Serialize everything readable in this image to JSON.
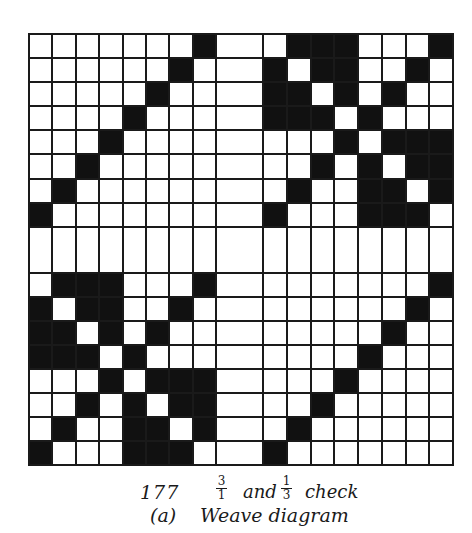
{
  "figure": {
    "number": "177",
    "title_fraction_1": {
      "numerator": "3",
      "denominator": "1"
    },
    "title_word_and": "and",
    "title_fraction_2": {
      "numerator": "1",
      "denominator": "3"
    },
    "title_word_check": "check",
    "subfigure_label": "(a)",
    "subfigure_title": "Weave diagram"
  },
  "colors": {
    "filled": "#111111",
    "empty": "#ffffff",
    "grid_line": "#1a1a1a"
  },
  "weave_grid": {
    "description": "18x18 point-paper grid: two 8x8 blocks per axis separated by a wider blank spacer column/row. 1 = filled (warp up), 0 = empty.",
    "column_groups": [
      8,
      1,
      8
    ],
    "row_groups": [
      8,
      1,
      8
    ],
    "blocks": {
      "diagonal_twill": [
        [
          0,
          0,
          0,
          0,
          0,
          0,
          0,
          1
        ],
        [
          0,
          0,
          0,
          0,
          0,
          0,
          1,
          0
        ],
        [
          0,
          0,
          0,
          0,
          0,
          1,
          0,
          0
        ],
        [
          0,
          0,
          0,
          0,
          1,
          0,
          0,
          0
        ],
        [
          0,
          0,
          0,
          1,
          0,
          0,
          0,
          0
        ],
        [
          0,
          0,
          1,
          0,
          0,
          0,
          0,
          0
        ],
        [
          0,
          1,
          0,
          0,
          0,
          0,
          0,
          0
        ],
        [
          1,
          0,
          0,
          0,
          0,
          0,
          0,
          0
        ]
      ],
      "check_block": [
        [
          0,
          1,
          1,
          1,
          0,
          0,
          0,
          1
        ],
        [
          1,
          0,
          1,
          1,
          0,
          0,
          1,
          0
        ],
        [
          1,
          1,
          0,
          1,
          0,
          1,
          0,
          0
        ],
        [
          1,
          1,
          1,
          0,
          1,
          0,
          0,
          0
        ],
        [
          0,
          0,
          0,
          1,
          0,
          1,
          1,
          1
        ],
        [
          0,
          0,
          1,
          0,
          1,
          0,
          1,
          1
        ],
        [
          0,
          1,
          0,
          0,
          1,
          1,
          0,
          1
        ],
        [
          1,
          0,
          0,
          0,
          1,
          1,
          1,
          0
        ]
      ]
    },
    "layout": {
      "top_left": "diagonal_twill",
      "top_right": "check_block",
      "bottom_left": "check_block",
      "bottom_right": "diagonal_twill"
    }
  }
}
